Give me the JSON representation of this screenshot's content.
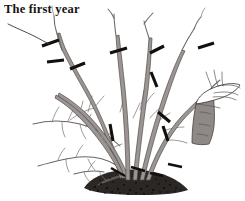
{
  "figure": {
    "title": "The first year",
    "background_color": "#ffffff",
    "width": 245,
    "height": 201
  },
  "caption": {
    "text": "The first year",
    "color": "#15120f",
    "position": "top-left",
    "has_leader_line": true,
    "leader_points_to": "cut-mark-upper-left"
  },
  "palette": {
    "background": "#ffffff",
    "cane_fill": "#9b9693",
    "cane_outline": "#514d4a",
    "twig": "#6b6663",
    "cut_mark": "#120f0d",
    "soil": "#2b2724",
    "soil_highlight": "#5d5854",
    "text": "#15120f"
  },
  "plant": {
    "label": "shrub",
    "cane_count": 7,
    "cut_mark_count": 14,
    "canes": [
      {
        "name": "cane-far-left-arching",
        "direction": "left"
      },
      {
        "name": "cane-left-lower-arching",
        "direction": "left"
      },
      {
        "name": "cane-left-upright",
        "direction": "up-left"
      },
      {
        "name": "cane-center-upright",
        "direction": "up"
      },
      {
        "name": "cane-center-right-upright",
        "direction": "up"
      },
      {
        "name": "cane-right-upright",
        "direction": "up-right"
      },
      {
        "name": "cane-far-right-arching",
        "direction": "right"
      }
    ]
  },
  "cut_marks": [
    {
      "name": "cut-mark-upper-left",
      "note": "target of caption leader line"
    },
    {
      "name": "cut-mark-left-mid-upper"
    },
    {
      "name": "cut-mark-left-mid-lower"
    },
    {
      "name": "cut-mark-center-left"
    },
    {
      "name": "cut-mark-center-top"
    },
    {
      "name": "cut-mark-center-right-top"
    },
    {
      "name": "cut-mark-center-right-mid"
    },
    {
      "name": "cut-mark-right-upper"
    },
    {
      "name": "cut-mark-far-right-top"
    },
    {
      "name": "cut-mark-mid-stem"
    },
    {
      "name": "cut-mark-right-lower"
    },
    {
      "name": "cut-mark-base-left"
    },
    {
      "name": "cut-mark-base-center"
    },
    {
      "name": "cut-mark-base-right"
    }
  ],
  "inset": {
    "name": "cut-stem-detail",
    "description": "enlarged detail of a pruned stem showing the angled cut surface",
    "position": "right"
  },
  "ground": {
    "name": "soil-mound",
    "description": "mounded dark soil at the base of the shrub"
  }
}
